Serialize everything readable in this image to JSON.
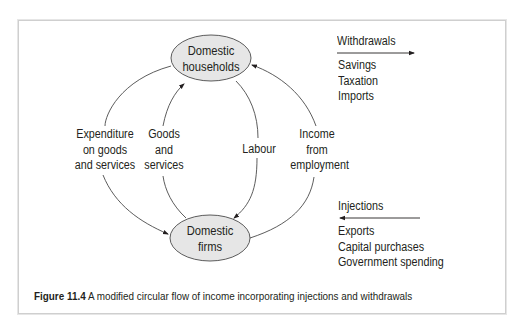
{
  "nodes": {
    "households": {
      "line1": "Domestic",
      "line2": "households"
    },
    "firms": {
      "line1": "Domestic",
      "line2": "firms"
    }
  },
  "flows": {
    "expenditure": {
      "line1": "Expenditure",
      "line2": "on goods",
      "line3": "and services"
    },
    "goods": {
      "line1": "Goods",
      "line2": "and",
      "line3": "services"
    },
    "labour": {
      "line1": "Labour"
    },
    "income": {
      "line1": "Income",
      "line2": "from",
      "line3": "employment"
    }
  },
  "withdrawals": {
    "title": "Withdrawals",
    "items": [
      "Savings",
      "Taxation",
      "Imports"
    ]
  },
  "injections": {
    "title": "Injections",
    "items": [
      "Exports",
      "Capital purchases",
      "Government spending"
    ]
  },
  "caption": {
    "label": "Figure 11.4",
    "text": " A modified circular flow of income incorporating injections and withdrawals"
  },
  "colors": {
    "node_fill": "#e6e6e6",
    "line": "#4a4a4a",
    "text": "#231f20",
    "frame": "#cfcfcf"
  }
}
